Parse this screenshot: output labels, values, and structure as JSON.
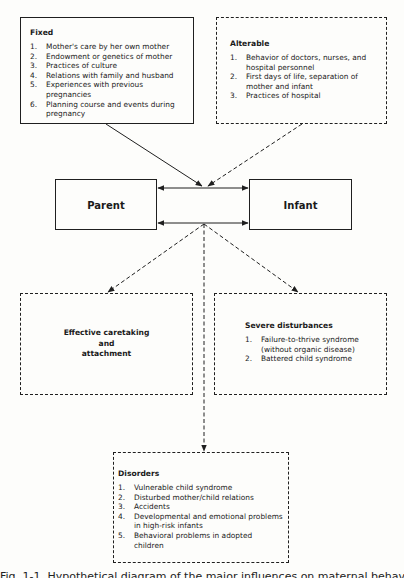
{
  "diagram": {
    "fixed": {
      "title": "Fixed",
      "border": "solid",
      "items": [
        {
          "num": "1.",
          "text": "Mother's care by her own mother"
        },
        {
          "num": "2.",
          "text": "Endowment or genetics of mother"
        },
        {
          "num": "3.",
          "text": "Practices of culture"
        },
        {
          "num": "4.",
          "text": "Relations with family and husband"
        },
        {
          "num": "5.",
          "text": "Experiences with previous pregnancies"
        },
        {
          "num": "6.",
          "text": "Planning course and events during pregnancy"
        }
      ]
    },
    "alterable": {
      "title": "Alterable",
      "border": "dashed",
      "items": [
        {
          "num": "1.",
          "text": "Behavior of doctors, nurses, and hospital personnel"
        },
        {
          "num": "2.",
          "text": "First days of life, separation of mother and infant"
        },
        {
          "num": "3.",
          "text": "Practices of hospital"
        }
      ]
    },
    "parent": {
      "label": "Parent",
      "border": "solid"
    },
    "infant": {
      "label": "Infant",
      "border": "solid"
    },
    "effective": {
      "lines": [
        "Effective caretaking",
        "and",
        "attachment"
      ],
      "border": "dashed"
    },
    "severe": {
      "title": "Severe disturbances",
      "border": "dashed",
      "items": [
        {
          "num": "1.",
          "text": "Failure-to-thrive syndrome (without organic disease)"
        },
        {
          "num": "2.",
          "text": "Battered child syndrome"
        }
      ]
    },
    "disorders": {
      "title": "Disorders",
      "border": "dashed",
      "items": [
        {
          "num": "1.",
          "text": "Vulnerable child syndrome"
        },
        {
          "num": "2.",
          "text": "Disturbed mother/child relations"
        },
        {
          "num": "3.",
          "text": "Accidents"
        },
        {
          "num": "4.",
          "text": "Developmental and emotional problems in high-risk infants"
        },
        {
          "num": "5.",
          "text": "Behavioral problems in adopted children"
        }
      ]
    },
    "edges": [
      {
        "from": "fixed",
        "to": "parent-infant-link",
        "style": "solid"
      },
      {
        "from": "alterable",
        "to": "parent-infant-link",
        "style": "dashed"
      },
      {
        "from": "parent",
        "to": "infant",
        "style": "solid",
        "direction": "bidirectional"
      },
      {
        "from": "parent",
        "to": "infant",
        "style": "solid",
        "direction": "bidirectional"
      },
      {
        "from": "parent-infant-link",
        "to": "effective",
        "style": "dashed"
      },
      {
        "from": "parent-infant-link",
        "to": "severe",
        "style": "dashed"
      },
      {
        "from": "parent-infant-link",
        "to": "disorders",
        "style": "dashed"
      }
    ],
    "colors": {
      "ink": "#1f1f1f",
      "paper": "#fdfdfb"
    }
  },
  "caption": {
    "text": "Fig. 1-1. Hypothetical diagram of the major influences on maternal behavior and the resulting outcomes."
  }
}
